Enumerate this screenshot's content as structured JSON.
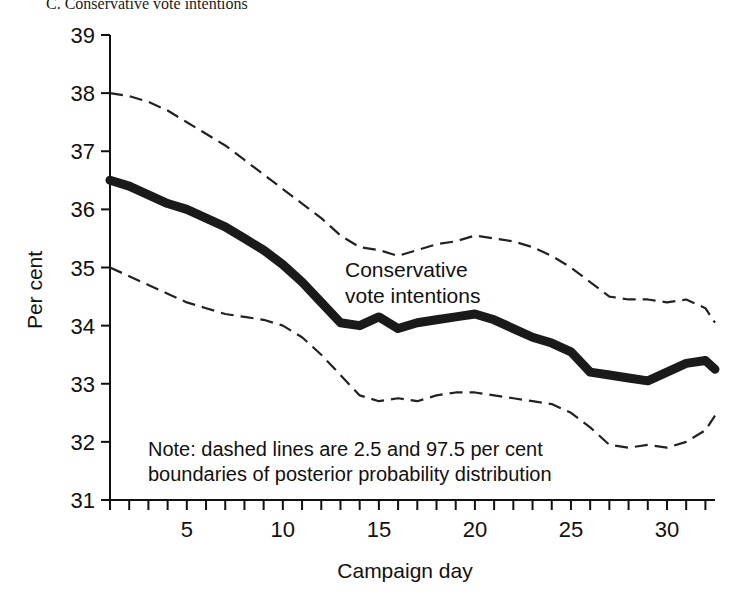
{
  "panel": {
    "title": "C. Conservative vote intentions"
  },
  "annotations": {
    "series_label_line1": "Conservative",
    "series_label_line2": "vote intentions",
    "note_line1": "Note: dashed lines are 2.5 and 97.5 per cent",
    "note_line2": "boundaries of posterior probability distribution"
  },
  "colors": {
    "central_line": "#1a1a1a",
    "bound_line": "#222222",
    "axis": "#111111",
    "background": "#ffffff"
  },
  "chart_data": {
    "type": "line",
    "title": "C. Conservative vote intentions",
    "xlabel": "Campaign day",
    "ylabel": "Per cent",
    "xlim": [
      1,
      32.5
    ],
    "ylim": [
      31,
      39
    ],
    "grid": false,
    "legend_position": "inline-annotation",
    "y_ticks": [
      31,
      32,
      33,
      34,
      35,
      36,
      37,
      38,
      39
    ],
    "x_ticks": [
      1,
      2,
      3,
      4,
      5,
      6,
      7,
      8,
      9,
      10,
      11,
      12,
      13,
      14,
      15,
      16,
      17,
      18,
      19,
      20,
      21,
      22,
      23,
      24,
      25,
      26,
      27,
      28,
      29,
      30,
      31,
      32
    ],
    "x_tick_labels": [
      5,
      10,
      15,
      20,
      25,
      30
    ],
    "x": [
      1,
      2,
      3,
      4,
      5,
      6,
      7,
      8,
      9,
      10,
      11,
      12,
      13,
      14,
      15,
      16,
      17,
      18,
      19,
      20,
      21,
      22,
      23,
      24,
      25,
      26,
      27,
      28,
      29,
      30,
      31,
      32,
      32.5
    ],
    "series": [
      {
        "name": "Conservative vote intentions",
        "style": "solid-thick",
        "values": [
          36.5,
          36.4,
          36.25,
          36.1,
          36.0,
          35.85,
          35.7,
          35.5,
          35.3,
          35.05,
          34.75,
          34.4,
          34.05,
          34.0,
          34.15,
          33.95,
          34.05,
          34.1,
          34.15,
          34.2,
          34.1,
          33.95,
          33.8,
          33.7,
          33.55,
          33.2,
          33.15,
          33.1,
          33.05,
          33.2,
          33.35,
          33.4,
          33.25
        ]
      },
      {
        "name": "97.5 per cent boundary",
        "style": "dashed",
        "values": [
          38.0,
          37.95,
          37.85,
          37.7,
          37.5,
          37.3,
          37.1,
          36.85,
          36.6,
          36.35,
          36.1,
          35.85,
          35.55,
          35.35,
          35.3,
          35.2,
          35.3,
          35.4,
          35.45,
          35.55,
          35.5,
          35.45,
          35.35,
          35.2,
          35.0,
          34.75,
          34.5,
          34.45,
          34.45,
          34.4,
          34.45,
          34.3,
          34.05
        ]
      },
      {
        "name": "2.5 per cent boundary",
        "style": "dashed",
        "values": [
          35.0,
          34.85,
          34.7,
          34.55,
          34.4,
          34.3,
          34.2,
          34.15,
          34.1,
          34.0,
          33.8,
          33.5,
          33.15,
          32.8,
          32.7,
          32.75,
          32.7,
          32.8,
          32.85,
          32.85,
          32.8,
          32.75,
          32.7,
          32.65,
          32.5,
          32.25,
          31.95,
          31.9,
          31.95,
          31.9,
          32.0,
          32.2,
          32.45
        ]
      }
    ]
  }
}
